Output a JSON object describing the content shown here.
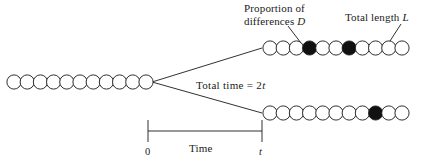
{
  "figure": {
    "type": "diagram",
    "background_color": "#ffffff",
    "stroke_color": "#1a1a1a",
    "fill_color": "#111111",
    "open_circle_color": "#ffffff"
  },
  "labels": {
    "proportion_line1": "Proportion of",
    "proportion_line2_text": "differences ",
    "proportion_line2_var": "D",
    "total_length_text": "Total length ",
    "total_length_var": "L",
    "total_time_text": "Total time  =  2",
    "total_time_var": "t",
    "time_axis": "Time",
    "axis_start": "0",
    "axis_end": "t"
  },
  "chart_data": {
    "type": "diagram",
    "chains": [
      {
        "name": "ancestral-sequence",
        "position": "left",
        "count": 11,
        "filled_indices": [],
        "x_start": 14,
        "y": 82,
        "spacing": 13.2,
        "radius": 7.1
      },
      {
        "name": "descendant-sequence-top",
        "position": "top-right",
        "count": 11,
        "filled_indices": [
          3,
          6
        ],
        "x_start": 270,
        "y": 48,
        "spacing": 13.2,
        "radius": 7.1
      },
      {
        "name": "descendant-sequence-bottom",
        "position": "bottom-right",
        "count": 11,
        "filled_indices": [
          8
        ],
        "x_start": 270,
        "y": 113,
        "spacing": 13.2,
        "radius": 7.1
      }
    ],
    "branch_point": {
      "x": 152,
      "y": 82
    },
    "branches": [
      {
        "name": "upper-branch",
        "from": [
          152,
          82
        ],
        "to": [
          262,
          48
        ]
      },
      {
        "name": "lower-branch",
        "from": [
          152,
          82
        ],
        "to": [
          262,
          113
        ]
      }
    ],
    "leaders": [
      {
        "name": "proportion-leader",
        "from": [
          288,
          26
        ],
        "to": [
          301,
          43
        ]
      },
      {
        "name": "total-length-leader",
        "from": [
          401,
          24
        ],
        "to": [
          390,
          41
        ]
      }
    ],
    "time_axis": {
      "name": "time-scale-bar",
      "x_start": 148,
      "x_end": 262,
      "y": 131,
      "tick_height": 11,
      "start_value": "0",
      "end_value": "t"
    }
  }
}
